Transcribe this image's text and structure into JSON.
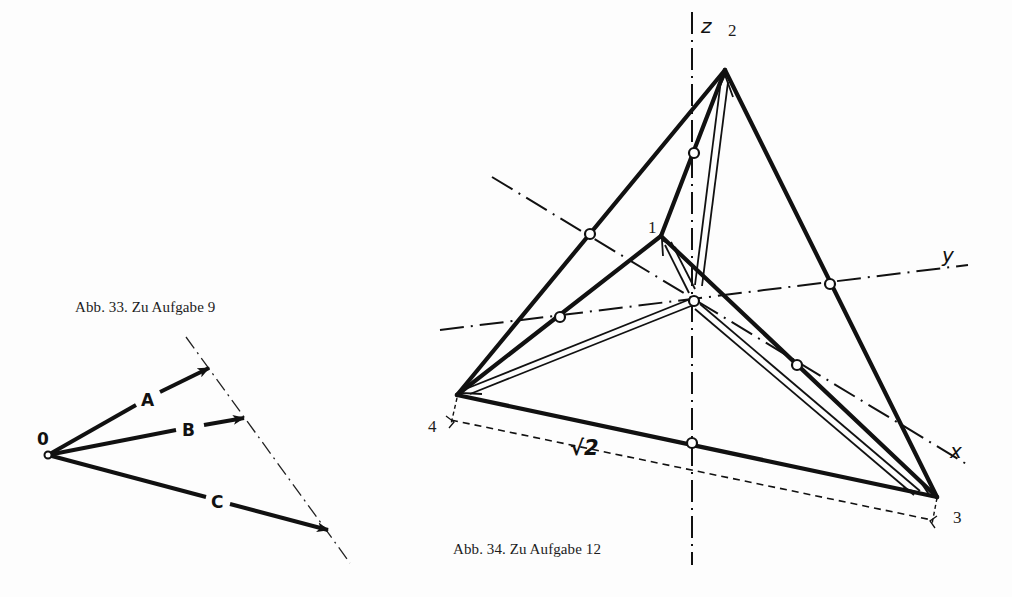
{
  "figures": {
    "fig33": {
      "caption": "Abb. 33. Zu Aufgabe 9",
      "origin_label": "0",
      "vectors": [
        {
          "label": "A"
        },
        {
          "label": "B"
        },
        {
          "label": "C"
        }
      ]
    },
    "fig34": {
      "caption": "Abb. 34. Zu Aufgabe 12",
      "axes": {
        "x": "x",
        "y": "y",
        "z": "z"
      },
      "vertices": [
        "1",
        "2",
        "3",
        "4"
      ],
      "edge_length_label": "√2"
    }
  },
  "colors": {
    "ink": "#111111",
    "paper": "#fdfdfd"
  }
}
